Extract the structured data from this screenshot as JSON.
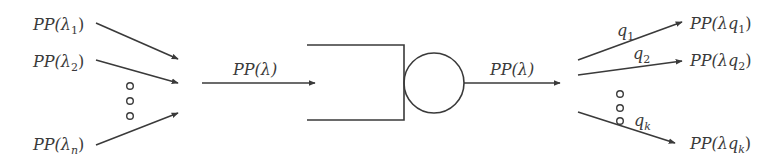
{
  "diagram": {
    "colors": {
      "stroke": "#3a3a3a",
      "text": "#3a3a3a",
      "background": "#ffffff"
    },
    "inputs": [
      {
        "prefix": "PP(λ",
        "sub": "1",
        "suffix": ")"
      },
      {
        "prefix": "PP(λ",
        "sub": "2",
        "suffix": ")"
      },
      {
        "prefix": "PP(λ",
        "sub": "n",
        "suffix": ")"
      }
    ],
    "merged_input_label": "PP(λ)",
    "queue": {
      "type": "single-server queue",
      "buffer": "open rectangle",
      "server": "circle"
    },
    "output_label": "PP(λ)",
    "split_probabilities": [
      {
        "prefix": "q",
        "sub": "1"
      },
      {
        "prefix": "q",
        "sub": "2"
      },
      {
        "prefix": "q",
        "sub": "k"
      }
    ],
    "outputs": [
      {
        "prefix": "PP(λq",
        "sub": "1",
        "suffix": ")"
      },
      {
        "prefix": "PP(λq",
        "sub": "2",
        "suffix": ")"
      },
      {
        "prefix": "PP(λq",
        "sub": "k",
        "suffix": ")"
      }
    ],
    "ellipsis": "three vertical circles"
  }
}
